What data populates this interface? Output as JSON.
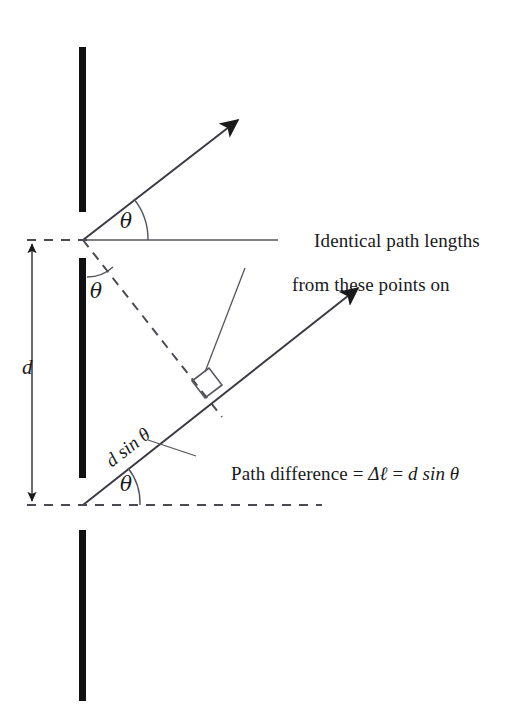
{
  "figure": {
    "kind": "physics-diagram",
    "background_color": "#ffffff",
    "ink_color": "#1a1a1a",
    "barrier_color": "#111111"
  },
  "labels": {
    "theta_upper_ray": "θ",
    "theta_slit_interior": "θ",
    "theta_lower_axis": "θ",
    "slit_separation": "d",
    "path_segment": "d sin θ",
    "annotation_line1": "Identical path lengths",
    "annotation_line2": "from these points on",
    "path_difference_prefix": "Path difference = ",
    "path_difference_delta": "Δℓ",
    "path_difference_equals": " = ",
    "path_difference_value": "d sin θ",
    "path_difference_full": "Path difference = Δℓ = d sin θ"
  },
  "geometry": {
    "upper_slit_point": {
      "x": 83,
      "y": 240
    },
    "lower_slit_point": {
      "x": 83,
      "y": 505
    },
    "upper_ray_tip": {
      "x": 242,
      "y": 116
    },
    "lower_ray_tip": {
      "x": 362,
      "y": 285
    },
    "ray_angle_degrees": 38,
    "barriers": [
      {
        "name": "top-barrier",
        "x": 82,
        "y_start": 47,
        "y_end": 212
      },
      {
        "name": "middle-barrier",
        "x": 82,
        "y_start": 258,
        "y_end": 478
      },
      {
        "name": "bottom-barrier",
        "x": 82,
        "y_start": 530,
        "y_end": 701
      }
    ],
    "barrier_thickness": 7,
    "dimension_arrow_x": 32,
    "horizontal_reference_line": {
      "x_start": 83,
      "x_end": 278,
      "y": 240
    },
    "bottom_dashed_axis": {
      "x_start": 27,
      "x_end": 322,
      "y": 505
    },
    "right_angle_marker": {
      "x": 207,
      "y": 392
    }
  }
}
